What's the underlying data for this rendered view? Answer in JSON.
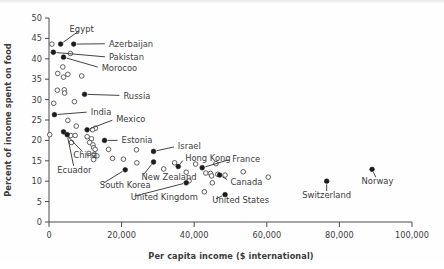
{
  "chart_data": {
    "type": "scatter",
    "title": "",
    "xlabel": "Per capita income ($ international)",
    "ylabel": "Percent of income spent on food",
    "xlim": [
      0,
      100000
    ],
    "ylim": [
      0,
      50
    ],
    "xticks": [
      0,
      20000,
      40000,
      60000,
      80000,
      100000
    ],
    "xtick_labels": [
      "0",
      "20,000",
      "40,000",
      "60,000",
      "80,000",
      "100,000"
    ],
    "yticks": [
      0,
      5,
      10,
      15,
      20,
      25,
      30,
      35,
      40,
      45,
      50
    ],
    "ytick_labels": [
      "0",
      "5",
      "10",
      "15",
      "20",
      "25",
      "30",
      "35",
      "40",
      "45",
      "50"
    ],
    "grid": false,
    "legend": "none",
    "marker_styles": {
      "labeled": "filled-circle",
      "unlabeled": "open-circle"
    },
    "labeled_points": [
      {
        "name": "Egypt",
        "x": 3200,
        "y": 43.6,
        "label_x": 9000,
        "label_y": 47.3,
        "anchor": "middle"
      },
      {
        "name": "Azerbaijan",
        "x": 6800,
        "y": 43.6,
        "label_x": 16500,
        "label_y": 43.7,
        "anchor": "start"
      },
      {
        "name": "Pakistan",
        "x": 1200,
        "y": 41.6,
        "label_x": 16500,
        "label_y": 40.4,
        "anchor": "start"
      },
      {
        "name": "Morocoo",
        "x": 4000,
        "y": 40.4,
        "label_x": 14500,
        "label_y": 37.7,
        "anchor": "start"
      },
      {
        "name": "Russia",
        "x": 9800,
        "y": 31.3,
        "label_x": 20500,
        "label_y": 31.0,
        "anchor": "start"
      },
      {
        "name": "India",
        "x": 1500,
        "y": 26.3,
        "label_x": 11500,
        "label_y": 27.0,
        "anchor": "start"
      },
      {
        "name": "Mexico",
        "x": 10500,
        "y": 22.6,
        "label_x": 18500,
        "label_y": 25.3,
        "anchor": "start"
      },
      {
        "name": "China",
        "x": 4000,
        "y": 22.1,
        "label_x": 10000,
        "label_y": 16.5,
        "anchor": "middle"
      },
      {
        "name": "Ecuador",
        "x": 5000,
        "y": 21.4,
        "label_x": 7000,
        "label_y": 12.8,
        "anchor": "middle"
      },
      {
        "name": "Estonia",
        "x": 15300,
        "y": 20.0,
        "label_x": 20000,
        "label_y": 20.0,
        "anchor": "start"
      },
      {
        "name": "Israel",
        "x": 28800,
        "y": 17.3,
        "label_x": 35500,
        "label_y": 18.6,
        "anchor": "start"
      },
      {
        "name": "Hong Kong",
        "x": 35600,
        "y": 13.6,
        "label_x": 37500,
        "label_y": 15.8,
        "anchor": "start"
      },
      {
        "name": "France",
        "x": 42200,
        "y": 13.3,
        "label_x": 50500,
        "label_y": 15.5,
        "anchor": "start"
      },
      {
        "name": "New Zealand",
        "x": 28800,
        "y": 14.7,
        "label_x": 25500,
        "label_y": 11.0,
        "anchor": "start"
      },
      {
        "name": "South Korea",
        "x": 21000,
        "y": 12.8,
        "label_x": 14000,
        "label_y": 9.0,
        "anchor": "start"
      },
      {
        "name": "United Kingdom",
        "x": 37800,
        "y": 9.6,
        "label_x": 22500,
        "label_y": 6.1,
        "anchor": "start"
      },
      {
        "name": "Canada",
        "x": 47000,
        "y": 11.5,
        "label_x": 50000,
        "label_y": 9.9,
        "anchor": "start"
      },
      {
        "name": "United States",
        "x": 48500,
        "y": 6.7,
        "label_x": 45000,
        "label_y": 5.3,
        "anchor": "start"
      },
      {
        "name": "Switzerland",
        "x": 76500,
        "y": 10.0,
        "label_x": 76500,
        "label_y": 6.6,
        "anchor": "middle"
      },
      {
        "name": "Norway",
        "x": 89000,
        "y": 12.9,
        "label_x": 90500,
        "label_y": 10.1,
        "anchor": "middle"
      }
    ],
    "unlabeled_points": [
      {
        "x": 800,
        "y": 43.6
      },
      {
        "x": 5900,
        "y": 41.3
      },
      {
        "x": 3800,
        "y": 38.0
      },
      {
        "x": 2400,
        "y": 36.4
      },
      {
        "x": 4000,
        "y": 35.5
      },
      {
        "x": 5200,
        "y": 36.2
      },
      {
        "x": 9000,
        "y": 35.8
      },
      {
        "x": 2300,
        "y": 32.3
      },
      {
        "x": 4200,
        "y": 32.4
      },
      {
        "x": 4300,
        "y": 31.6
      },
      {
        "x": 1300,
        "y": 29.1
      },
      {
        "x": 7000,
        "y": 29.5
      },
      {
        "x": 5200,
        "y": 24.9
      },
      {
        "x": 7500,
        "y": 23.5
      },
      {
        "x": 12800,
        "y": 23.0
      },
      {
        "x": 12000,
        "y": 22.6
      },
      {
        "x": 200,
        "y": 21.4
      },
      {
        "x": 6000,
        "y": 21.2
      },
      {
        "x": 7200,
        "y": 21.2
      },
      {
        "x": 10500,
        "y": 20.9
      },
      {
        "x": 11700,
        "y": 20.4
      },
      {
        "x": 6200,
        "y": 19.5
      },
      {
        "x": 11200,
        "y": 19.5
      },
      {
        "x": 12100,
        "y": 18.9
      },
      {
        "x": 12300,
        "y": 18.2
      },
      {
        "x": 12700,
        "y": 17.8
      },
      {
        "x": 16400,
        "y": 17.8
      },
      {
        "x": 24100,
        "y": 17.7
      },
      {
        "x": 11000,
        "y": 16.8
      },
      {
        "x": 12500,
        "y": 16.6
      },
      {
        "x": 13200,
        "y": 16.2
      },
      {
        "x": 12300,
        "y": 15.3
      },
      {
        "x": 17500,
        "y": 15.6
      },
      {
        "x": 20500,
        "y": 15.4
      },
      {
        "x": 24200,
        "y": 14.5
      },
      {
        "x": 31600,
        "y": 13.0
      },
      {
        "x": 34600,
        "y": 14.5
      },
      {
        "x": 40400,
        "y": 14.2
      },
      {
        "x": 46000,
        "y": 14.3
      },
      {
        "x": 37800,
        "y": 12.2
      },
      {
        "x": 43200,
        "y": 12.0
      },
      {
        "x": 44500,
        "y": 11.9
      },
      {
        "x": 44800,
        "y": 11.3
      },
      {
        "x": 46500,
        "y": 11.7
      },
      {
        "x": 48500,
        "y": 11.5
      },
      {
        "x": 53500,
        "y": 12.3
      },
      {
        "x": 60400,
        "y": 11.0
      },
      {
        "x": 38600,
        "y": 10.1
      },
      {
        "x": 45000,
        "y": 9.6
      },
      {
        "x": 42800,
        "y": 7.4
      }
    ]
  },
  "axis": {
    "x_title": "Per capita income ($ international)",
    "y_title": "Percent of income spent on food"
  }
}
